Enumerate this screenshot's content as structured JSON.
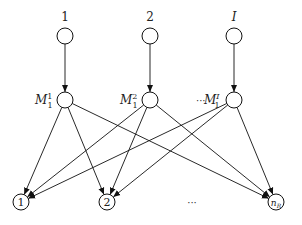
{
  "diagram": {
    "type": "network graph",
    "top_nodes": [
      {
        "id": "t1",
        "label": "1",
        "x": 65,
        "y": 36
      },
      {
        "id": "t2",
        "label": "2",
        "x": 150,
        "y": 36
      },
      {
        "id": "tI",
        "label": "I",
        "x": 234,
        "y": 36
      }
    ],
    "middle_nodes": [
      {
        "id": "m1",
        "label_base": "M",
        "label_sub": "1",
        "label_sup": "1",
        "x": 65,
        "y": 100
      },
      {
        "id": "m2",
        "label_base": "M",
        "label_sub": "1",
        "label_sup": "2",
        "x": 150,
        "y": 100
      },
      {
        "id": "mI",
        "label_base": "M",
        "label_sub": "1",
        "label_sup": "I",
        "x": 234,
        "y": 100
      }
    ],
    "middle_ellipsis": "···",
    "bottom_nodes": [
      {
        "id": "b1",
        "label": "1",
        "x": 21,
        "y": 202
      },
      {
        "id": "b2",
        "label": "2",
        "x": 107,
        "y": 202
      },
      {
        "id": "bR",
        "label_base": "n",
        "label_sub": "R",
        "x": 276,
        "y": 202
      }
    ],
    "bottom_ellipsis": "···",
    "edges": [
      [
        "t1",
        "m1"
      ],
      [
        "t2",
        "m2"
      ],
      [
        "tI",
        "mI"
      ],
      [
        "m1",
        "b1"
      ],
      [
        "m1",
        "b2"
      ],
      [
        "m1",
        "bR"
      ],
      [
        "m2",
        "b1"
      ],
      [
        "m2",
        "b2"
      ],
      [
        "m2",
        "bR"
      ],
      [
        "mI",
        "b1"
      ],
      [
        "mI",
        "b2"
      ],
      [
        "mI",
        "bR"
      ]
    ]
  }
}
